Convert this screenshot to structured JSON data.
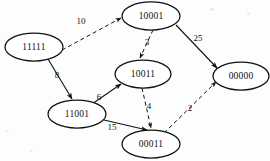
{
  "diagram": {
    "type": "weighted-directed-graph",
    "background_color": "#fdfdfd",
    "stroke_color": "#111111",
    "nodes": [
      {
        "id": "n-11111",
        "label": "11111",
        "cx": 34,
        "cy": 47,
        "rx": 29,
        "ry": 14
      },
      {
        "id": "n-10001",
        "label": "10001",
        "cx": 151,
        "cy": 16,
        "rx": 29,
        "ry": 14
      },
      {
        "id": "n-10011",
        "label": "10011",
        "cx": 143,
        "cy": 74,
        "rx": 28,
        "ry": 14
      },
      {
        "id": "n-00000",
        "label": "00000",
        "cx": 241,
        "cy": 76,
        "rx": 28,
        "ry": 14
      },
      {
        "id": "n-11001",
        "label": "11001",
        "cx": 77,
        "cy": 114,
        "rx": 29,
        "ry": 14
      },
      {
        "id": "n-00011",
        "label": "00011",
        "cx": 151,
        "cy": 144,
        "rx": 29,
        "ry": 14
      }
    ],
    "edges": [
      {
        "id": "e-11111-10001",
        "from": "11111",
        "to": "10001",
        "weight": "10",
        "style": "dashed",
        "label_x": 81,
        "label_y": 21
      },
      {
        "id": "e-10001-10011",
        "from": "10001",
        "to": "10011",
        "weight": "3",
        "style": "dashed",
        "label_x": 147,
        "label_y": 42
      },
      {
        "id": "e-10001-00000",
        "from": "10001",
        "to": "00000",
        "weight": "25",
        "style": "solid",
        "label_x": 198,
        "label_y": 38
      },
      {
        "id": "e-11111-11001",
        "from": "11111",
        "to": "11001",
        "weight": "8",
        "style": "solid",
        "label_x": 57,
        "label_y": 75
      },
      {
        "id": "e-11001-10011",
        "from": "11001",
        "to": "10011",
        "weight": "6",
        "style": "solid",
        "label_x": 99,
        "label_y": 97
      },
      {
        "id": "e-10011-00011",
        "from": "10011",
        "to": "00011",
        "weight": "4",
        "style": "dashed",
        "label_x": 149,
        "label_y": 106
      },
      {
        "id": "e-11001-00011",
        "from": "11001",
        "to": "00011",
        "weight": "15",
        "style": "solid",
        "label_x": 112,
        "label_y": 127
      },
      {
        "id": "e-00011-00000",
        "from": "00011",
        "to": "00000",
        "weight": "2",
        "style": "dashed",
        "label_x": 190,
        "label_y": 108
      }
    ]
  }
}
